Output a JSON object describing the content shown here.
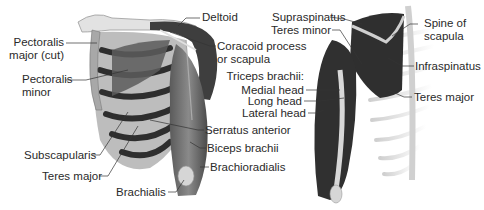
{
  "diagram": {
    "type": "anatomy",
    "views": [
      {
        "name": "anterior",
        "labels": {
          "pectoralis_major_line1": "Pectoralis",
          "pectoralis_major_line2": "major (cut)",
          "pectoralis_minor_line1": "Pectoralis",
          "pectoralis_minor_line2": "minor",
          "deltoid": "Deltoid",
          "coracoid_line1": "Coracoid process",
          "coracoid_line2": "or scapula",
          "serratus_anterior": "Serratus anterior",
          "biceps_brachii": "Biceps brachii",
          "brachioradialis": "Brachioradialis",
          "subscapularis": "Subscapularis",
          "teres_major": "Teres major",
          "brachialis": "Brachialis"
        }
      },
      {
        "name": "posterior",
        "labels": {
          "supraspinatus": "Supraspinatus",
          "teres_minor": "Teres minor",
          "spine_line1": "Spine of",
          "spine_line2": "scapula",
          "infraspinatus": "Infraspinatus",
          "teres_major": "Teres major",
          "triceps_heading": "Triceps brachii:",
          "medial_head": "Medial head",
          "long_head": "Long head",
          "lateral_head": "Lateral head"
        }
      }
    ],
    "colors": {
      "background": "#ffffff",
      "muscle_dark": "#3a3a3a",
      "muscle_mid": "#6e6e6e",
      "bone": "#d8d8d8",
      "leader_line": "#333333",
      "text": "#2a2a2a"
    }
  }
}
